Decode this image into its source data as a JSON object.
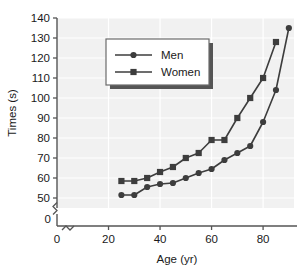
{
  "chart_data": {
    "type": "line",
    "title": "",
    "xlabel": "Age (yr)",
    "ylabel": "Times (s)",
    "xlim": [
      0,
      92
    ],
    "ylim": [
      45,
      140
    ],
    "xticks": [
      0,
      20,
      40,
      60,
      80
    ],
    "yticks": [
      50,
      60,
      70,
      80,
      90,
      100,
      110,
      120,
      130,
      140
    ],
    "y_origin_tick": "0",
    "x_origin_tick": "0",
    "axis_break": true,
    "grid": true,
    "legend_position": "upper-center-left",
    "series": [
      {
        "name": "Men",
        "marker": "circle",
        "color": "#3d3d3d",
        "x": [
          25,
          30,
          35,
          40,
          45,
          50,
          55,
          60,
          65,
          70,
          75,
          80,
          85,
          90
        ],
        "y": [
          51.5,
          51.5,
          55.5,
          57,
          57.5,
          60,
          62.5,
          64.5,
          69,
          72.5,
          76,
          88,
          104,
          135
        ]
      },
      {
        "name": "Women",
        "marker": "square",
        "color": "#3d3d3d",
        "x": [
          25,
          30,
          35,
          40,
          45,
          50,
          55,
          60,
          65,
          70,
          75,
          80,
          85
        ],
        "y": [
          58.5,
          58.5,
          60,
          63,
          65.5,
          70,
          72.5,
          79,
          79,
          90,
          100,
          110,
          128
        ]
      }
    ]
  },
  "legend": {
    "items": [
      {
        "label": "Men",
        "marker": "circle"
      },
      {
        "label": "Women",
        "marker": "square"
      }
    ]
  },
  "colors": {
    "plot_background": "#f1f1f1",
    "grid": "#ffffff",
    "axis": "#555555",
    "series": "#3d3d3d",
    "text": "#1a1a1a",
    "legend_background": "#ffffff",
    "legend_border": "#6b6b6b",
    "legend_shadow": "#555555"
  }
}
